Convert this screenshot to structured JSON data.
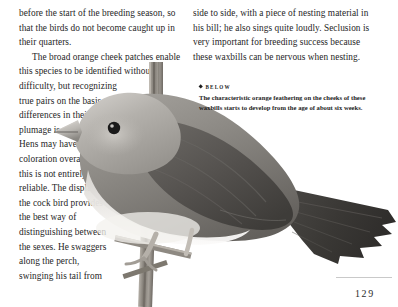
{
  "page": {
    "folio": "129",
    "background_color": "#ffffff",
    "text_color": "#262626"
  },
  "left_column": {
    "para_continued": "before the start of the breeding season, so that the birds do not become caught up in their quarters.",
    "para_wide": "The broad orange cheek patches enable this species to be identified without difficulty, but recognizing",
    "para_narrow": "true pairs on the basis of differences in their plumage is very difficult. Hens may have paler coloration overall, but this is not entirely reliable. The display of the cock bird provides the best way of distinguishing between the sexes. He swaggers along the perch, swinging his tail from"
  },
  "right_column": {
    "para_continued": "side to side, with a piece of nesting material in his bill; he also sings quite loudly. Seclusion is very important for breeding success because these waxbills can be nervous when nesting."
  },
  "caption": {
    "bullet": "diamond-bullet",
    "label": "BELOW",
    "body": "The characteristic orange feathering on the cheeks of these waxbills starts to develop from the age of about six weeks."
  },
  "photograph": {
    "subject": "waxbill-perched-on-branch",
    "treatment": "grayscale",
    "colors": {
      "body_light": "#c9c6c2",
      "body_mid": "#9a9792",
      "body_dark": "#6e6b67",
      "wing_dark": "#4a4845",
      "tail_dark": "#3b3936",
      "belly_pale": "#eceae6",
      "perch": "#8d8880",
      "eye": "#1a1a1a"
    }
  }
}
